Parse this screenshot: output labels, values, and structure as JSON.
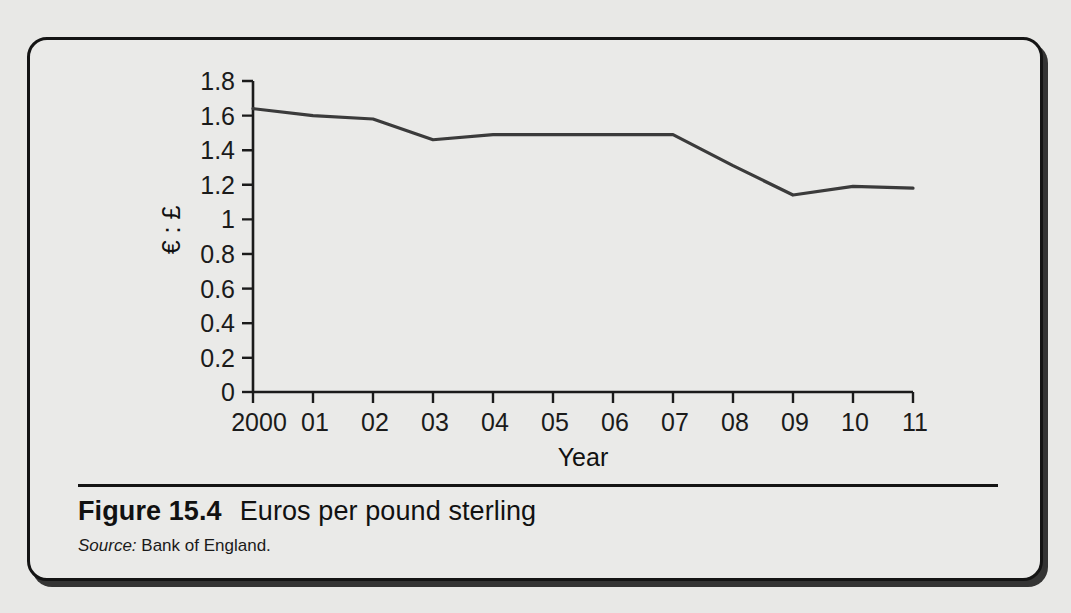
{
  "figure": {
    "caption_number": "Figure 15.4",
    "caption_text": "Euros per pound sterling",
    "source_label": "Source:",
    "source_value": "Bank of England."
  },
  "chart_data": {
    "type": "line",
    "title": "",
    "xlabel": "Year",
    "ylabel": "€ : £",
    "categories": [
      "2000",
      "01",
      "02",
      "03",
      "04",
      "05",
      "06",
      "07",
      "08",
      "09",
      "10",
      "11"
    ],
    "x": [
      2000,
      2001,
      2002,
      2003,
      2004,
      2005,
      2006,
      2007,
      2008,
      2009,
      2010,
      2011
    ],
    "values": [
      1.64,
      1.6,
      1.58,
      1.46,
      1.49,
      1.49,
      1.49,
      1.49,
      1.31,
      1.14,
      1.19,
      1.18
    ],
    "series": [
      {
        "name": "Euros per pound sterling",
        "values": [
          1.64,
          1.6,
          1.58,
          1.46,
          1.49,
          1.49,
          1.49,
          1.49,
          1.31,
          1.14,
          1.19,
          1.18
        ],
        "color": "#3b3b3b"
      }
    ],
    "ylim": [
      0,
      1.8
    ],
    "yticks": [
      0,
      0.2,
      0.4,
      0.6,
      0.8,
      1,
      1.2,
      1.4,
      1.6,
      1.8
    ],
    "ytick_labels": [
      "0",
      "0.2",
      "0.4",
      "0.6",
      "0.8",
      "1",
      "1.2",
      "1.4",
      "1.6",
      "1.8"
    ],
    "xlim": [
      2000,
      2011
    ],
    "grid": false,
    "legend": false,
    "legend_position": "none"
  },
  "colors": {
    "page_background": "#e8e8e6",
    "panel_background": "#eaeae8",
    "border": "#141414",
    "ink": "#1b1b1b",
    "line": "#3b3b3b"
  }
}
